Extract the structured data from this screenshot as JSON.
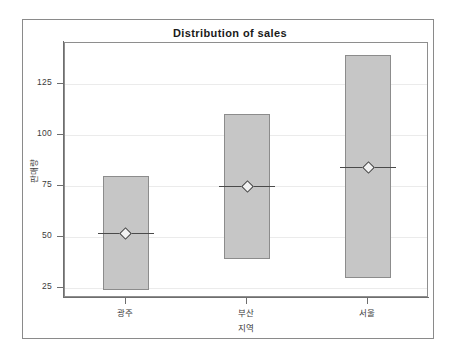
{
  "chart_data": {
    "type": "bar",
    "title": "Distribution of sales",
    "xlabel": "지역",
    "ylabel": "판매량",
    "categories": [
      "광주",
      "부산",
      "서울"
    ],
    "ylim": [
      20,
      145
    ],
    "yticks": [
      25,
      50,
      75,
      100,
      125
    ],
    "ytick_labels": [
      "25",
      "50",
      "75",
      "100",
      "125"
    ],
    "grid": true,
    "legend": "none",
    "series": [
      {
        "name": "range",
        "bars": [
          {
            "category": "광주",
            "low": 24,
            "high": 80,
            "median": 52
          },
          {
            "category": "부산",
            "low": 39,
            "high": 110,
            "median": 75
          },
          {
            "category": "서울",
            "low": 30,
            "high": 139,
            "median": 84
          }
        ]
      }
    ],
    "colors": {
      "bar_fill": "#c6c6c6",
      "bar_border": "#8c8c8c",
      "median_line": "#4a4a4a",
      "marker_fill": "#f2f2f2",
      "marker_border": "#3c3c3c",
      "grid": "#ebebeb",
      "axis": "#6e6e6e",
      "frame": "#8a8a8a",
      "text": "#3b3b3b",
      "background": "#ffffff"
    }
  }
}
